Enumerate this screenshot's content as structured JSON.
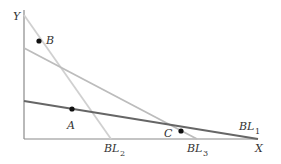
{
  "diagram": {
    "type": "budget-line diagram",
    "axes": {
      "x_label": "X",
      "y_label": "Y"
    },
    "lines": [
      {
        "id": "BL1",
        "label": "BL",
        "subscript": "1",
        "color": "#666666",
        "x1": 24,
        "y1": 101,
        "x2": 258,
        "y2": 139
      },
      {
        "id": "BL2",
        "label": "BL",
        "subscript": "2",
        "color": "#d0d0d0",
        "x1": 24,
        "y1": 15,
        "x2": 111,
        "y2": 139
      },
      {
        "id": "BL3",
        "label": "BL",
        "subscript": "3",
        "color": "#bcbcbc",
        "x1": 24,
        "y1": 48,
        "x2": 197,
        "y2": 139
      }
    ],
    "points": [
      {
        "id": "A",
        "label": "A",
        "cx": 72,
        "cy": 109
      },
      {
        "id": "B",
        "label": "B",
        "cx": 39,
        "cy": 41
      },
      {
        "id": "C",
        "label": "C",
        "cx": 181,
        "cy": 131
      }
    ],
    "colors": {
      "axis": "#8a8a8a",
      "point": "#111111",
      "text": "#333333"
    }
  }
}
